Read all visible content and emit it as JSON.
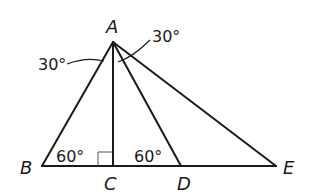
{
  "diagram": {
    "points": {
      "A": {
        "label": "A",
        "x": 113,
        "y": 42
      },
      "B": {
        "label": "B",
        "x": 42,
        "y": 166
      },
      "C": {
        "label": "C",
        "x": 113,
        "y": 166
      },
      "D": {
        "label": "D",
        "x": 181,
        "y": 166
      },
      "E": {
        "label": "E",
        "x": 276,
        "y": 166
      }
    },
    "segments": [
      "AB",
      "AC",
      "AD",
      "AE",
      "BE"
    ],
    "angles": {
      "BAC": {
        "label": "30°"
      },
      "DAE": {
        "label": "30°"
      },
      "ABC": {
        "label": "60°"
      },
      "ADC": {
        "label": "60°"
      },
      "ACB": {
        "label": "right angle"
      }
    }
  }
}
